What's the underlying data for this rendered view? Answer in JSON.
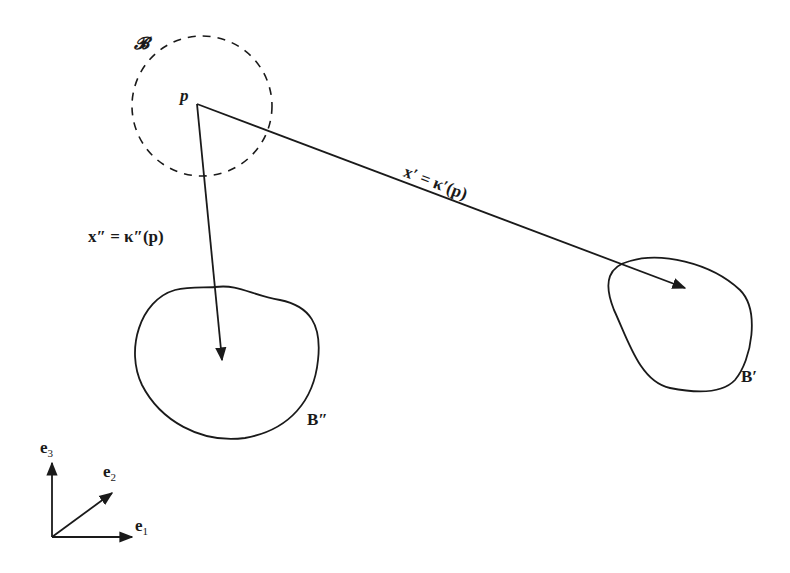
{
  "diagram": {
    "reference_body": {
      "label": "𝓑",
      "point_label": "p",
      "style": "dashed-circle"
    },
    "mappings": [
      {
        "name": "kappa-prime",
        "label": "x′ = κ′(p)",
        "target": "B′"
      },
      {
        "name": "kappa-double-prime",
        "label": "x″ = κ″(p)",
        "target": "B″"
      }
    ],
    "configurations": [
      {
        "label": "B′"
      },
      {
        "label": "B″"
      }
    ],
    "basis": [
      {
        "label": "e",
        "index": "1"
      },
      {
        "label": "e",
        "index": "2"
      },
      {
        "label": "e",
        "index": "3"
      }
    ],
    "colors": {
      "stroke": "#1a1a1a",
      "background": "#ffffff"
    }
  }
}
